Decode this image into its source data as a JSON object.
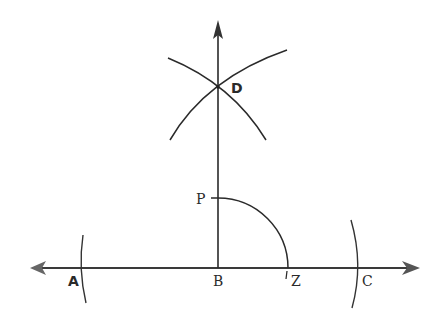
{
  "diagram": {
    "type": "geometric-construction",
    "colors": {
      "line": "#2a2a2a",
      "background": "#ffffff"
    },
    "points": {
      "A": {
        "label": "A",
        "x": 82,
        "y": 268
      },
      "B": {
        "label": "B",
        "x": 218,
        "y": 268
      },
      "Z": {
        "label": "Z",
        "x": 288,
        "y": 268
      },
      "C": {
        "label": "C",
        "x": 358,
        "y": 268
      },
      "D": {
        "label": "D",
        "x": 218,
        "y": 87
      },
      "P": {
        "label": "P",
        "x": 218,
        "y": 198
      }
    },
    "labels": {
      "A": "A",
      "B": "B",
      "Z": "Z",
      "C": "C",
      "D": "D",
      "P": "P"
    },
    "lines": [
      {
        "name": "horizontal-line-AC",
        "from": [
          30,
          268
        ],
        "to": [
          418,
          268
        ],
        "arrows": "both"
      },
      {
        "name": "perpendicular-BD",
        "from": [
          218,
          268
        ],
        "to": [
          218,
          20
        ],
        "arrows": "end"
      }
    ],
    "arcs": [
      {
        "name": "arc-at-A",
        "center_of_arc": "A"
      },
      {
        "name": "arc-at-C",
        "center_of_arc": "C"
      },
      {
        "name": "arc-from-A-through-D"
      },
      {
        "name": "arc-from-C-through-D"
      },
      {
        "name": "quarter-arc-PZ",
        "center": "B",
        "radius": 70
      }
    ]
  }
}
